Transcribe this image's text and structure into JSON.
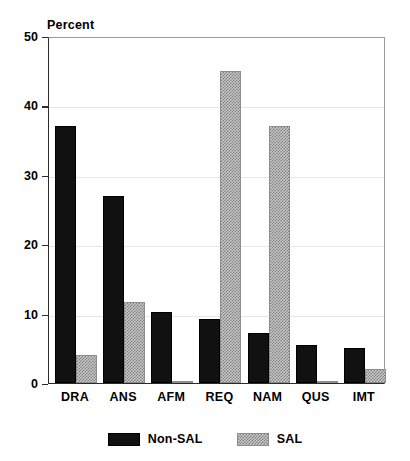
{
  "chart_data": {
    "type": "bar",
    "title": "",
    "ylabel": "Percent",
    "xlabel": "",
    "ylim": [
      0,
      50
    ],
    "yticks": [
      0,
      10,
      20,
      30,
      40,
      50
    ],
    "ytick_labels": [
      "0",
      "10",
      "20",
      "30",
      "40",
      "50"
    ],
    "grid": true,
    "grid_axis": "y",
    "legend_position": "bottom-center",
    "categories": [
      "DRA",
      "ANS",
      "AFM",
      "REQ",
      "NAM",
      "QUS",
      "IMT"
    ],
    "series": [
      {
        "name": "Non-SAL",
        "color": "#111111",
        "fill": "solid",
        "values": [
          37,
          27,
          10.2,
          9.2,
          7.2,
          5.5,
          5
        ]
      },
      {
        "name": "SAL",
        "color": "#c9c9c9",
        "fill": "hatched",
        "values": [
          4,
          11.7,
          0.2,
          45,
          37,
          0.2,
          2
        ]
      }
    ]
  },
  "legend": {
    "entries": [
      {
        "label": "Non-SAL",
        "swatch": "solid-black-swatch"
      },
      {
        "label": "SAL",
        "swatch": "hatched-gray-swatch"
      }
    ]
  },
  "axes": {
    "y_axis_title": "Percent"
  }
}
